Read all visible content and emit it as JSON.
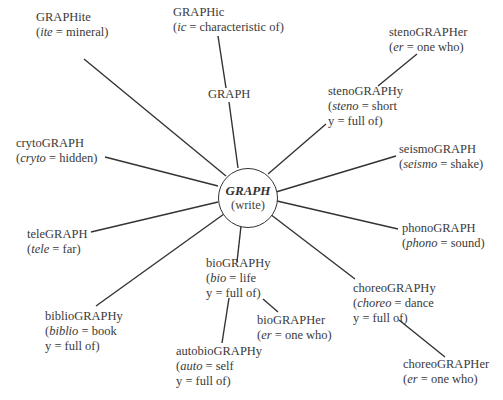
{
  "center": {
    "root": "GRAPH",
    "meaning": "(write)"
  },
  "nodes": {
    "graphite": {
      "word": "GRAPHite",
      "lines": [
        "(",
        "ite",
        " = mineral)"
      ]
    },
    "graphic": {
      "word": "GRAPHic",
      "lines": [
        "(",
        "ic",
        " = characteristic of)"
      ]
    },
    "graph": {
      "word": "GRAPH"
    },
    "stenographer": {
      "word": "stenoGRAPHer",
      "line1_pre": "(",
      "line1_it": "er",
      "line1_post": " = one who)"
    },
    "stenography": {
      "word": "stenoGRAPHy",
      "line1_pre": "(",
      "line1_it": "steno",
      "line1_post": " = short",
      "line2": "y = full of)"
    },
    "crytograph": {
      "word": "crytoGRAPH",
      "line1_pre": "(",
      "line1_it": "cryto",
      "line1_post": " = hidden)"
    },
    "seismograph": {
      "word": "seismoGRAPH",
      "line1_pre": "(",
      "line1_it": "seismo",
      "line1_post": " = shake)"
    },
    "telegraph": {
      "word": "teleGRAPH",
      "line1_pre": "(",
      "line1_it": "tele",
      "line1_post": " = far)"
    },
    "phonograph": {
      "word": "phonoGRAPH",
      "line1_pre": "(",
      "line1_it": "phono",
      "line1_post": " = sound)"
    },
    "biography": {
      "word": "bioGRAPHy",
      "line1_pre": "(",
      "line1_it": "bio",
      "line1_post": " = life",
      "line2": "y = full of)"
    },
    "choreography": {
      "word": "choreoGRAPHy",
      "line1_pre": "(",
      "line1_it": "choreo",
      "line1_post": " = dance",
      "line2": "y = full of)"
    },
    "bibliography": {
      "word": "biblioGRAPHy",
      "line1_pre": "(",
      "line1_it": "biblio",
      "line1_post": " = book",
      "line2": "y = full of)"
    },
    "biographer": {
      "word": "bioGRAPHer",
      "line1_pre": "(",
      "line1_it": "er",
      "line1_post": " = one who)"
    },
    "autobiography": {
      "word": "autobioGRAPHy",
      "line1_pre": "(",
      "line1_it": "auto",
      "line1_post": " = self",
      "line2": "y = full of)"
    },
    "choreographer": {
      "word": "choreoGRAPHer",
      "line1_pre": "(",
      "line1_it": "er",
      "line1_post": " = one who)"
    }
  },
  "colors": {
    "line": "#333333",
    "text": "#3a3a3a",
    "background": "#ffffff"
  }
}
